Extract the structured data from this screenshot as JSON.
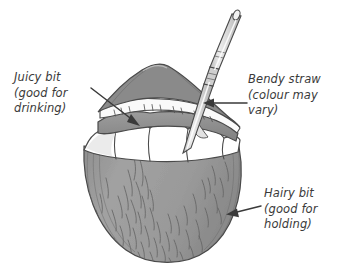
{
  "figure": {
    "background_color": "#ffffff",
    "ink_color": "#3a3a3a",
    "shell_gray": "#9a9a9a",
    "shell_gray_dark": "#808080",
    "flesh_white": "#ffffff",
    "straw_gray": "#d8d8d8",
    "width": 346,
    "height": 278
  },
  "annotations": [
    {
      "id": "juicy",
      "name": "juicy-bit",
      "line1": "Juicy bit",
      "line2": "(good for",
      "line3": "drinking)",
      "arrow": {
        "from_x": 91,
        "from_y": 88,
        "to_x": 139,
        "to_y": 125
      }
    },
    {
      "id": "straw",
      "name": "bendy-straw",
      "line1": "Bendy straw",
      "line2": "(colour may",
      "line3": "vary)",
      "arrow": {
        "from_x": 247,
        "from_y": 103,
        "to_x": 204,
        "to_y": 103
      }
    },
    {
      "id": "hairy",
      "name": "hairy-bit",
      "line1": "Hairy bit",
      "line2": "(good for",
      "line3": "holding)",
      "arrow": {
        "from_x": 261,
        "from_y": 206,
        "to_x": 227,
        "to_y": 214
      }
    }
  ],
  "illustration": {
    "subject": "coconut with drinking straw",
    "parts": [
      {
        "name": "coconut-husk",
        "fill": "#9a9a9a",
        "description": "hairy outer husk lower body"
      },
      {
        "name": "coconut-flesh",
        "fill": "#ffffff",
        "description": "white scalloped inner flesh"
      },
      {
        "name": "coconut-lip",
        "fill": "#8f8f8f",
        "description": "cut rim lip of shell"
      },
      {
        "name": "coconut-cap",
        "fill": "#8a8a8a",
        "description": "peaked cut top of shell"
      },
      {
        "name": "bendy-straw",
        "fill": "#d8d8d8",
        "description": "striped bendable drinking straw"
      }
    ]
  }
}
